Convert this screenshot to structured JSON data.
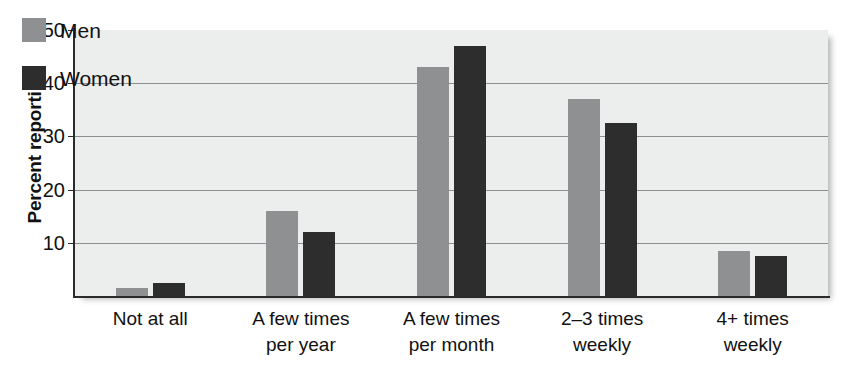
{
  "chart_data": {
    "type": "bar",
    "title": "",
    "subtitle": "",
    "xlabel": "",
    "ylabel": "Percent reporting",
    "ylim": [
      0,
      50
    ],
    "yticks": [
      10,
      20,
      30,
      40,
      50
    ],
    "ytick_labels": [
      "10",
      "20",
      "30",
      "40",
      "50"
    ],
    "grid": true,
    "legend_position": "top-left",
    "categories": [
      "Not at all",
      "A few times per year",
      "A few times per month",
      "2–3 times weekly",
      "4+ times weekly"
    ],
    "category_lines": [
      [
        "Not at all",
        ""
      ],
      [
        "A few times",
        "per year"
      ],
      [
        "A few times",
        "per month"
      ],
      [
        "2–3 times",
        "weekly"
      ],
      [
        "4+ times",
        "weekly"
      ]
    ],
    "series": [
      {
        "name": "Men",
        "color": "#8e9092",
        "values": [
          1.5,
          16.0,
          43.0,
          37.0,
          8.5
        ]
      },
      {
        "name": "Women",
        "color": "#2d2d2d",
        "values": [
          2.5,
          12.0,
          47.0,
          32.5,
          7.5
        ]
      }
    ]
  },
  "legend": {
    "items": [
      {
        "label": "Men",
        "color": "#8e9092"
      },
      {
        "label": "Women",
        "color": "#2d2d2d"
      }
    ]
  },
  "axes": {
    "y_title": "Percent reporting"
  },
  "colors": {
    "men": "#8e9092",
    "women": "#2d2d2d",
    "plot_background": "#eceded",
    "gridline": "#8c8f91",
    "axis": "#2b2b2b",
    "text": "#111111"
  }
}
